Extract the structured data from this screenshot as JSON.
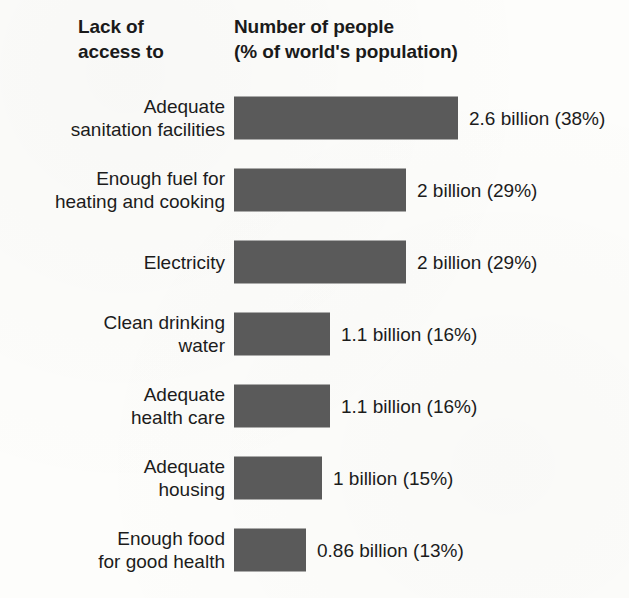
{
  "header": {
    "left_line1": "Lack of",
    "left_line2": "access to",
    "right_line1": "Number of people",
    "right_line2": "(% of world's population)"
  },
  "style": {
    "bar_color": "#5a5a5a",
    "background_color": "#fdfdfb",
    "text_color": "#1c1c1c"
  },
  "rows": [
    {
      "label_line1": "Adequate",
      "label_line2": "sanitation facilities",
      "value_label": "2.6 billion (38%)",
      "bar_width": "224px"
    },
    {
      "label_line1": "Enough fuel for",
      "label_line2": "heating and cooking",
      "value_label": "2 billion (29%)",
      "bar_width": "172px"
    },
    {
      "label_line1": "Electricity",
      "label_line2": "",
      "value_label": "2 billion (29%)",
      "bar_width": "172px"
    },
    {
      "label_line1": "Clean drinking",
      "label_line2": "water",
      "value_label": "1.1 billion (16%)",
      "bar_width": "96px"
    },
    {
      "label_line1": "Adequate",
      "label_line2": "health care",
      "value_label": "1.1 billion (16%)",
      "bar_width": "96px"
    },
    {
      "label_line1": "Adequate",
      "label_line2": "housing",
      "value_label": "1 billion (15%)",
      "bar_width": "88px"
    },
    {
      "label_line1": "Enough food",
      "label_line2": "for good health",
      "value_label": "0.86 billion (13%)",
      "bar_width": "72px"
    }
  ],
  "chart_data": {
    "type": "bar",
    "orientation": "horizontal",
    "title": "Lack of access to",
    "subtitle": "Number of people (% of world's population)",
    "xlabel": "",
    "ylabel": "Lack of access to",
    "grid": false,
    "legend": "none",
    "categories": [
      "Adequate sanitation facilities",
      "Enough fuel for heating and cooking",
      "Electricity",
      "Clean drinking water",
      "Adequate health care",
      "Adequate housing",
      "Enough food for good health"
    ],
    "values": [
      38,
      29,
      29,
      16,
      16,
      15,
      13
    ],
    "value_unit": "% of world's population",
    "people_billions": [
      2.6,
      2,
      2,
      1.1,
      1.1,
      1,
      0.86
    ],
    "data_labels": [
      "2.6 billion (38%)",
      "2 billion (29%)",
      "2 billion (29%)",
      "1.1 billion (16%)",
      "1.1 billion (16%)",
      "1 billion (15%)",
      "0.86 billion (13%)"
    ],
    "xlim": [
      0,
      38
    ]
  }
}
